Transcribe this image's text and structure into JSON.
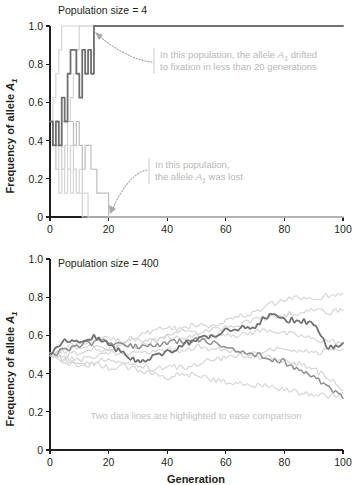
{
  "figure": {
    "xlabel": "Generation",
    "ylabel_prefix": "Frequency of allele ",
    "ylabel_allele": "A",
    "ylabel_allele_sub": "1"
  },
  "panels": [
    {
      "id": "top",
      "title": "Population size = 4",
      "annotations": [
        {
          "id": "fixation-note",
          "line1_a": "In this population, the allele ",
          "line1_allele": "A",
          "line1_allele_sub": "1",
          "line1_b": " drifted",
          "line2": "to fixation in less than 20 generations"
        },
        {
          "id": "lost-note",
          "line1": "In this population,",
          "line2_a": "the allele ",
          "line2_allele": "A",
          "line2_allele_sub": "1",
          "line2_b": " was lost"
        }
      ]
    },
    {
      "id": "bottom",
      "title": "Population size = 400",
      "caption": "Two data lines are highlighted to ease comparison"
    }
  ],
  "colors": {
    "axis": "#231f20",
    "trace_light": "#d5d5d5",
    "trace_mid": "#bdbdbd",
    "trace_dark": "#6f6f6f",
    "trace_dark_secondary": "#8d8d8d",
    "note_text": "#b8b8b8",
    "caption_text": "#c2c2c2"
  },
  "chart_data": [
    {
      "type": "line",
      "id": "population-size-4",
      "title": "Population size = 4",
      "xlabel": "",
      "ylabel": "Frequency of allele A1",
      "xlim": [
        0,
        100
      ],
      "ylim": [
        0,
        1.0
      ],
      "xticks": [
        0,
        20,
        40,
        60,
        80,
        100
      ],
      "yticks": [
        0,
        0.2,
        0.4,
        0.6,
        0.8,
        1.0
      ],
      "ytick_labels": [
        "0",
        "0.2",
        "0.4",
        "0.6",
        "0.8",
        "1.0"
      ],
      "grid": false,
      "legend": "none",
      "step_size": 0.125,
      "annotations": [
        "In this population, the allele A1 drifted to fixation in less than 20 generations",
        "In this population, the allele A1 was lost"
      ],
      "series": [
        {
          "name": "fixed-population",
          "emphasis": "dark",
          "x": [
            0,
            1,
            2,
            3,
            4,
            5,
            6,
            7,
            8,
            9,
            10,
            11,
            12,
            13,
            14,
            15,
            16,
            17,
            100
          ],
          "values": [
            0.5,
            0.375,
            0.5,
            0.375,
            0.625,
            0.5,
            0.75,
            0.875,
            0.875,
            0.75,
            0.625,
            0.875,
            0.75,
            0.875,
            0.75,
            1.0,
            1.0,
            1.0,
            1.0
          ]
        },
        {
          "name": "lost-population",
          "emphasis": "mid",
          "x": [
            0,
            1,
            2,
            3,
            4,
            5,
            6,
            7,
            8,
            9,
            10,
            11,
            12,
            13,
            14,
            15,
            16,
            17,
            18,
            19,
            20,
            100
          ],
          "values": [
            0.5,
            0.375,
            0.375,
            0.375,
            0.5,
            0.5,
            0.5,
            0.5,
            0.375,
            0.5,
            0.375,
            0.25,
            0.375,
            0.375,
            0.25,
            0.25,
            0.125,
            0.125,
            0.125,
            0.125,
            0.0,
            0.0
          ]
        },
        {
          "name": "light-trajectory-1",
          "emphasis": "light",
          "x": [
            0,
            1,
            2,
            3,
            4,
            5,
            6,
            7,
            100
          ],
          "values": [
            0.5,
            0.625,
            0.75,
            0.875,
            1.0,
            1.0,
            1.0,
            1.0,
            1.0
          ]
        },
        {
          "name": "light-trajectory-2",
          "emphasis": "light",
          "x": [
            0,
            1,
            2,
            3,
            4,
            5,
            6,
            7,
            8,
            9,
            10,
            11,
            12,
            13,
            100
          ],
          "values": [
            0.5,
            0.375,
            0.5,
            0.375,
            0.25,
            0.375,
            0.5,
            0.625,
            0.75,
            0.875,
            1.0,
            1.0,
            1.0,
            1.0,
            1.0
          ]
        },
        {
          "name": "light-trajectory-3",
          "emphasis": "light",
          "x": [
            0,
            1,
            2,
            3,
            4,
            5,
            6,
            7,
            8,
            9,
            10,
            11,
            12,
            13,
            14,
            100
          ],
          "values": [
            0.5,
            0.375,
            0.25,
            0.375,
            0.25,
            0.375,
            0.25,
            0.375,
            0.25,
            0.125,
            0.25,
            0.125,
            0.125,
            0.0,
            0.0,
            0.0
          ]
        },
        {
          "name": "light-trajectory-4",
          "emphasis": "light",
          "x": [
            0,
            1,
            2,
            3,
            4,
            5,
            6,
            7,
            8,
            9,
            10,
            11,
            12,
            100
          ],
          "values": [
            0.5,
            0.375,
            0.25,
            0.125,
            0.25,
            0.125,
            0.25,
            0.125,
            0.25,
            0.125,
            0.125,
            0.0,
            0.0,
            0.0
          ]
        }
      ]
    },
    {
      "type": "line",
      "id": "population-size-400",
      "title": "Population size = 400",
      "xlabel": "Generation",
      "ylabel": "Frequency of allele A1",
      "xlim": [
        0,
        100
      ],
      "ylim": [
        0,
        1.0
      ],
      "xticks": [
        0,
        20,
        40,
        60,
        80,
        100
      ],
      "yticks": [
        0,
        0.2,
        0.4,
        0.6,
        0.8,
        1.0
      ],
      "ytick_labels": [
        "0",
        "0.2",
        "0.4",
        "0.6",
        "0.8",
        "1.0"
      ],
      "grid": false,
      "legend": "none",
      "caption": "Two data lines are highlighted to ease comparison",
      "series": [
        {
          "name": "highlighted-line-upper",
          "emphasis": "dark",
          "x": [
            0,
            5,
            10,
            15,
            20,
            25,
            30,
            35,
            40,
            45,
            50,
            55,
            60,
            65,
            70,
            75,
            80,
            85,
            90,
            95,
            100
          ],
          "values": [
            0.5,
            0.58,
            0.57,
            0.59,
            0.55,
            0.51,
            0.46,
            0.49,
            0.51,
            0.55,
            0.58,
            0.59,
            0.63,
            0.64,
            0.65,
            0.71,
            0.68,
            0.68,
            0.66,
            0.53,
            0.56
          ]
        },
        {
          "name": "highlighted-line-lower",
          "emphasis": "dark-secondary",
          "x": [
            0,
            5,
            10,
            15,
            20,
            25,
            30,
            35,
            40,
            45,
            50,
            55,
            60,
            65,
            70,
            75,
            80,
            85,
            90,
            95,
            100
          ],
          "values": [
            0.5,
            0.52,
            0.55,
            0.56,
            0.57,
            0.55,
            0.54,
            0.55,
            0.56,
            0.57,
            0.58,
            0.56,
            0.54,
            0.52,
            0.5,
            0.48,
            0.46,
            0.42,
            0.38,
            0.33,
            0.27
          ]
        },
        {
          "name": "light-line-1",
          "emphasis": "light",
          "x": [
            0,
            5,
            10,
            15,
            20,
            25,
            30,
            35,
            40,
            45,
            50,
            55,
            60,
            65,
            70,
            75,
            80,
            85,
            90,
            95,
            100
          ],
          "values": [
            0.5,
            0.53,
            0.56,
            0.58,
            0.59,
            0.57,
            0.6,
            0.62,
            0.64,
            0.63,
            0.66,
            0.65,
            0.68,
            0.7,
            0.72,
            0.76,
            0.78,
            0.8,
            0.79,
            0.81,
            0.82
          ]
        },
        {
          "name": "light-line-2",
          "emphasis": "light",
          "x": [
            0,
            5,
            10,
            15,
            20,
            25,
            30,
            35,
            40,
            45,
            50,
            55,
            60,
            65,
            70,
            75,
            80,
            85,
            90,
            95,
            100
          ],
          "values": [
            0.5,
            0.52,
            0.54,
            0.55,
            0.53,
            0.56,
            0.58,
            0.57,
            0.6,
            0.62,
            0.61,
            0.63,
            0.64,
            0.66,
            0.68,
            0.7,
            0.71,
            0.72,
            0.73,
            0.72,
            0.73
          ]
        },
        {
          "name": "light-line-3",
          "emphasis": "light",
          "x": [
            0,
            5,
            10,
            15,
            20,
            25,
            30,
            35,
            40,
            45,
            50,
            55,
            60,
            65,
            70,
            75,
            80,
            85,
            90,
            95,
            100
          ],
          "values": [
            0.5,
            0.49,
            0.51,
            0.53,
            0.52,
            0.55,
            0.54,
            0.57,
            0.59,
            0.58,
            0.6,
            0.59,
            0.61,
            0.6,
            0.62,
            0.63,
            0.61,
            0.6,
            0.58,
            0.57,
            0.56
          ]
        },
        {
          "name": "light-line-4",
          "emphasis": "light",
          "x": [
            0,
            5,
            10,
            15,
            20,
            25,
            30,
            35,
            40,
            45,
            50,
            55,
            60,
            65,
            70,
            75,
            80,
            85,
            90,
            95,
            100
          ],
          "values": [
            0.5,
            0.48,
            0.47,
            0.49,
            0.51,
            0.5,
            0.52,
            0.51,
            0.53,
            0.52,
            0.54,
            0.53,
            0.52,
            0.51,
            0.5,
            0.52,
            0.53,
            0.52,
            0.51,
            0.52,
            0.53
          ]
        },
        {
          "name": "light-line-5",
          "emphasis": "light",
          "x": [
            0,
            5,
            10,
            15,
            20,
            25,
            30,
            35,
            40,
            45,
            50,
            55,
            60,
            65,
            70,
            75,
            80,
            85,
            90,
            95,
            100
          ],
          "values": [
            0.5,
            0.47,
            0.45,
            0.46,
            0.48,
            0.46,
            0.44,
            0.42,
            0.44,
            0.43,
            0.45,
            0.47,
            0.48,
            0.5,
            0.49,
            0.48,
            0.47,
            0.45,
            0.42,
            0.38,
            0.31
          ]
        },
        {
          "name": "light-line-6",
          "emphasis": "light",
          "x": [
            0,
            5,
            10,
            15,
            20,
            25,
            30,
            35,
            40,
            45,
            50,
            55,
            60,
            65,
            70,
            75,
            80,
            85,
            90,
            95,
            100
          ],
          "values": [
            0.5,
            0.46,
            0.44,
            0.45,
            0.43,
            0.44,
            0.42,
            0.4,
            0.38,
            0.4,
            0.39,
            0.37,
            0.36,
            0.35,
            0.34,
            0.33,
            0.32,
            0.3,
            0.29,
            0.28,
            0.3
          ]
        }
      ]
    }
  ]
}
